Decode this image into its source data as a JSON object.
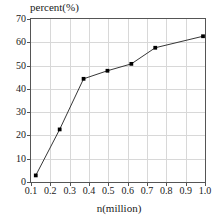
{
  "chart_data": {
    "type": "line",
    "title": "",
    "xlabel": "n(million)",
    "ylabel": "percent(%)",
    "xlim": [
      0.1,
      1.0
    ],
    "ylim": [
      0,
      70
    ],
    "grid": true,
    "legend": "none",
    "marker": "filled-square",
    "line_color": "#333333",
    "marker_color": "#000000",
    "xticks": [
      "0.1",
      "0.2",
      "0.3",
      "0.4",
      "0.5",
      "0.6",
      "0.7",
      "0.8",
      "0.9",
      "1.0"
    ],
    "xtick_values": [
      0.1,
      0.2,
      0.3,
      0.4,
      0.5,
      0.6,
      0.7,
      0.8,
      0.9,
      1.0
    ],
    "yticks": [
      "0",
      "10",
      "20",
      "30",
      "40",
      "50",
      "60",
      "70"
    ],
    "ytick_values": [
      0,
      10,
      20,
      30,
      40,
      50,
      60,
      70
    ],
    "x": [
      0.125,
      0.25,
      0.375,
      0.5,
      0.625,
      0.75,
      1.0
    ],
    "values": [
      2,
      22,
      44,
      47.5,
      50.5,
      57.5,
      62.5
    ],
    "series": [
      {
        "name": "percent",
        "x": [
          0.125,
          0.25,
          0.375,
          0.5,
          0.625,
          0.75,
          1.0
        ],
        "values": [
          2,
          22,
          44,
          47.5,
          50.5,
          57.5,
          62.5
        ]
      }
    ]
  }
}
